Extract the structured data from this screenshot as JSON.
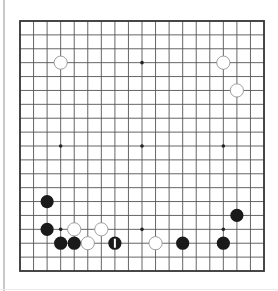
{
  "board": {
    "size": 19,
    "origin_x": 20,
    "origin_y": 21,
    "spacing_x": 13.556,
    "spacing_y": 13.889,
    "line_color": "#555555",
    "border_color": "#333333",
    "background": "#ffffff",
    "star_points": [
      [
        3,
        3
      ],
      [
        9,
        3
      ],
      [
        15,
        3
      ],
      [
        3,
        9
      ],
      [
        9,
        9
      ],
      [
        15,
        9
      ],
      [
        3,
        15
      ],
      [
        9,
        15
      ],
      [
        15,
        15
      ]
    ],
    "stones": [
      {
        "color": "white",
        "col": 3,
        "row": 3
      },
      {
        "color": "white",
        "col": 15,
        "row": 3
      },
      {
        "color": "white",
        "col": 16,
        "row": 5
      },
      {
        "color": "black",
        "col": 2,
        "row": 13
      },
      {
        "color": "black",
        "col": 16,
        "row": 14
      },
      {
        "color": "black",
        "col": 2,
        "row": 15
      },
      {
        "color": "white",
        "col": 4,
        "row": 15
      },
      {
        "color": "white",
        "col": 6,
        "row": 15
      },
      {
        "color": "black",
        "col": 3,
        "row": 16
      },
      {
        "color": "black",
        "col": 4,
        "row": 16
      },
      {
        "color": "white",
        "col": 5,
        "row": 16
      },
      {
        "color": "black",
        "col": 7,
        "row": 16,
        "last_move": true
      },
      {
        "color": "white",
        "col": 10,
        "row": 16
      },
      {
        "color": "black",
        "col": 12,
        "row": 16
      },
      {
        "color": "black",
        "col": 15,
        "row": 16
      }
    ],
    "colors": {
      "black_stone": "#1a1a1a",
      "white_stone": "#ffffff",
      "white_stone_outline": "#888888",
      "last_move_marker": "#ffffff"
    }
  }
}
